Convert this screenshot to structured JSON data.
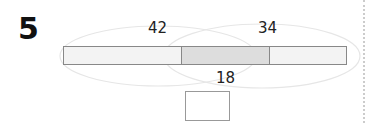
{
  "problem": {
    "number": "5",
    "labels": {
      "left_total": "42",
      "right_total": "34",
      "overlap": "18"
    },
    "answer_box": "",
    "colors": {
      "bar_fill": "#f2f2f2",
      "overlap_fill": "#dcdcdc",
      "bar_border": "#888888",
      "ellipse": "#e4e4e4"
    }
  }
}
